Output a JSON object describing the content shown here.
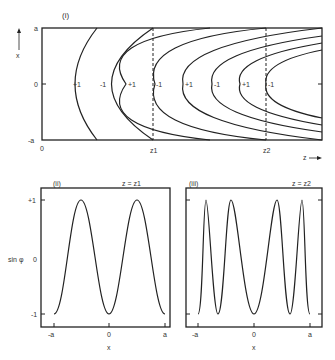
{
  "panel_i": {
    "label": "(i)",
    "y_axis_label": "x",
    "y_ticks": [
      "a",
      "0",
      "-a"
    ],
    "x_ticks": [
      "0",
      "z1",
      "z2"
    ],
    "x_axis_label": "z",
    "contour_labels": [
      "+1",
      "-1",
      "+1",
      "-1",
      "-1",
      "+1",
      "-1",
      "+1",
      "-1"
    ],
    "dashed_lines": [
      "z1",
      "z2"
    ]
  },
  "panel_ii": {
    "label": "(ii)",
    "condition": "z = z1",
    "y_axis_label": "sin φ",
    "y_ticks": [
      "+1",
      "0",
      "-1"
    ],
    "x_ticks": [
      "-a",
      "0",
      "a"
    ],
    "x_axis_label": "x"
  },
  "panel_iii": {
    "label": "(iii)",
    "condition": "z = z2",
    "x_ticks": [
      "-a",
      "0",
      "a"
    ],
    "x_axis_label": "x"
  }
}
